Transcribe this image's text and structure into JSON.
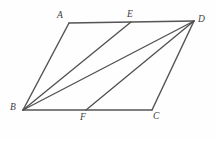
{
  "figure": {
    "background_color": "#fefefe",
    "line_color": "#4f4f4f",
    "label_color": "#3c3c3c",
    "labels": {
      "A": "A",
      "B": "B",
      "C": "C",
      "D": "D",
      "E": "E",
      "F": "F"
    },
    "points": {
      "A": {
        "x": 69,
        "y": 23
      },
      "B": {
        "x": 23,
        "y": 110
      },
      "C": {
        "x": 152,
        "y": 110
      },
      "D": {
        "x": 194,
        "y": 21
      },
      "E": {
        "x": 131,
        "y": 22
      },
      "F": {
        "x": 86,
        "y": 110
      }
    },
    "label_positions": {
      "A": {
        "x": 57,
        "y": 11
      },
      "B": {
        "x": 10,
        "y": 103
      },
      "C": {
        "x": 153,
        "y": 112
      },
      "D": {
        "x": 198,
        "y": 15
      },
      "E": {
        "x": 127,
        "y": 10
      },
      "F": {
        "x": 80,
        "y": 113
      }
    },
    "segments": [
      {
        "name": "side-AD",
        "from": "A",
        "to": "D",
        "kind": "edge"
      },
      {
        "name": "side-AB",
        "from": "A",
        "to": "B",
        "kind": "edge"
      },
      {
        "name": "side-BC",
        "from": "B",
        "to": "C",
        "kind": "edge"
      },
      {
        "name": "side-CD",
        "from": "C",
        "to": "D",
        "kind": "edge"
      },
      {
        "name": "segment-BE",
        "from": "B",
        "to": "E",
        "kind": "diagonal"
      },
      {
        "name": "segment-BD",
        "from": "B",
        "to": "D",
        "kind": "diagonal"
      },
      {
        "name": "segment-DF",
        "from": "D",
        "to": "F",
        "kind": "diagonal"
      }
    ]
  }
}
